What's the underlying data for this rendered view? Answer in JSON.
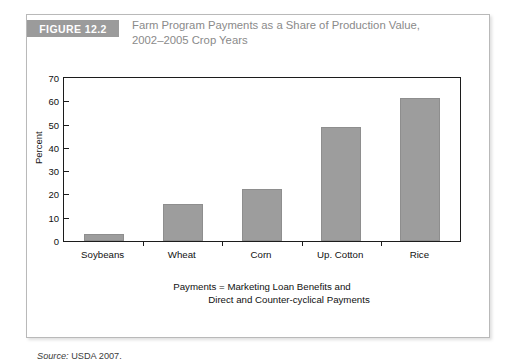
{
  "figure": {
    "badge": "FIGURE 12.2",
    "title_line_1": "Farm Program Payments as a Share of Production Value,",
    "title_line_2": "2002–2005 Crop Years",
    "source_keyword": "Source:",
    "source_text": " USDA 2007."
  },
  "chart_data": {
    "type": "bar",
    "title": "Farm Program Payments as a Share of Production Value, 2002–2005 Crop Years",
    "categories": [
      "Soybeans",
      "Wheat",
      "Corn",
      "Up. Cotton",
      "Rice"
    ],
    "values": [
      3,
      16,
      22.5,
      49,
      61.5
    ],
    "series": [
      {
        "name": "Share of Production Value",
        "values": [
          3,
          16,
          22.5,
          49,
          61.5
        ]
      }
    ],
    "xlabel": "Payments = Marketing Loan Benefits and Direct and Counter-cyclical Payments",
    "xlabel_line_1": "Payments = Marketing Loan Benefits and",
    "xlabel_line_2": "Direct and Counter-cyclical Payments",
    "ylabel": "Percent",
    "ylim": [
      0,
      70
    ],
    "yticks": [
      0,
      10,
      20,
      30,
      40,
      50,
      60,
      70
    ],
    "ytick_labels": [
      "0",
      "10",
      "20",
      "30",
      "40",
      "50",
      "60",
      "70"
    ],
    "grid": false,
    "legend": false,
    "bar_color": "#9d9d9d",
    "axis_color": "#1c1c1c"
  },
  "style": {
    "badge_bg": "#9b9b9b",
    "title_color": "#8a8a8a",
    "frame_border": "#b9b9b9"
  }
}
